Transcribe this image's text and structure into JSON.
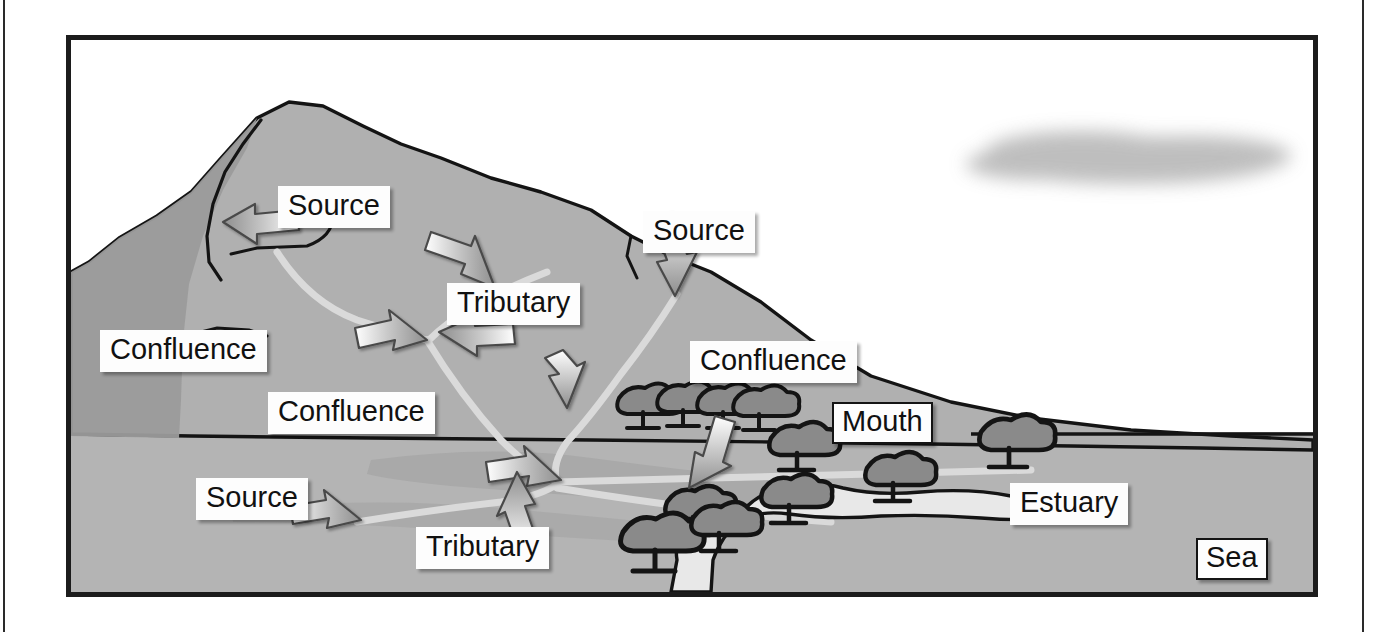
{
  "diagram": {
    "type": "river-course-diagram",
    "palette": {
      "land": "#b0b0b0",
      "land_shadow": "#9a9a9a",
      "land_dark": "#8e8e8e",
      "sea": "#b4b4b4",
      "river": "#d8d8d8",
      "estuary": "#e6e6e6",
      "outline": "#141414",
      "tree": "#8a8a8a",
      "cloud": "#b9b9b9",
      "label_bg": "#fdfdfd",
      "label_text": "#111111",
      "frame": "#1c1c1c"
    },
    "labels": [
      {
        "id": "source-mountain",
        "text": "Source",
        "x": 278,
        "y": 186,
        "bordered": false
      },
      {
        "id": "source-ridge",
        "text": "Source",
        "x": 643,
        "y": 211,
        "bordered": false
      },
      {
        "id": "tributary-upper",
        "text": "Tributary",
        "x": 447,
        "y": 283,
        "bordered": false
      },
      {
        "id": "confluence-upper",
        "text": "Confluence",
        "x": 100,
        "y": 330,
        "bordered": false
      },
      {
        "id": "confluence-right",
        "text": "Confluence",
        "x": 690,
        "y": 341,
        "bordered": false
      },
      {
        "id": "confluence-middle",
        "text": "Confluence",
        "x": 268,
        "y": 392,
        "bordered": false
      },
      {
        "id": "mouth",
        "text": "Mouth",
        "x": 832,
        "y": 402,
        "bordered": true
      },
      {
        "id": "source-lower",
        "text": "Source",
        "x": 196,
        "y": 478,
        "bordered": false
      },
      {
        "id": "estuary",
        "text": "Estuary",
        "x": 1010,
        "y": 483,
        "bordered": false
      },
      {
        "id": "tributary-lower",
        "text": "Tributary",
        "x": 416,
        "y": 527,
        "bordered": false
      },
      {
        "id": "sea",
        "text": "Sea",
        "x": 1196,
        "y": 538,
        "bordered": true
      }
    ],
    "features": {
      "cloud": "cloud-shape",
      "mountain": "mountain-ridge",
      "rivers": "river-network",
      "estuary_channel": "estuary-channel",
      "sea_region": "sea-region",
      "trees": "tree-cluster"
    },
    "arrow_count": 11,
    "tree_count": 11
  }
}
